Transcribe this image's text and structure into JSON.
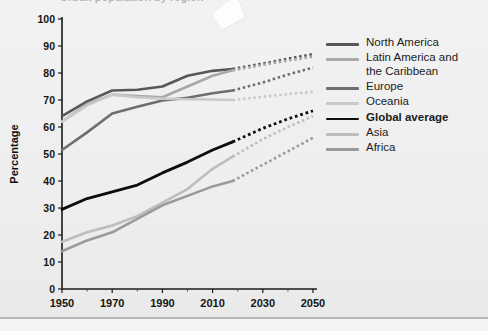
{
  "page": {
    "background_color": "#efefef",
    "partial_title_clipped": "Urban population by region"
  },
  "decor": {
    "paper_scrap_name": "paper-scrap-artifact"
  },
  "chart_data": {
    "type": "line",
    "title": "",
    "xlabel": "",
    "ylabel": "Percentage",
    "xlim": [
      1950,
      2050
    ],
    "ylim": [
      0,
      100
    ],
    "grid": false,
    "legend_position": "right",
    "x_ticks": [
      1950,
      1970,
      1990,
      2010,
      2030,
      2050
    ],
    "x_tick_labels": [
      "1950",
      "1970",
      "1990",
      "2010",
      "2030",
      "2050"
    ],
    "x_minor_ticks": [
      1960,
      1980,
      2000,
      2020,
      2040
    ],
    "y_ticks": [
      0,
      10,
      20,
      30,
      40,
      50,
      60,
      70,
      80,
      90,
      100
    ],
    "y_tick_labels": [
      "0",
      "10",
      "20",
      "30",
      "40",
      "50",
      "60",
      "70",
      "80",
      "90",
      "100"
    ],
    "projection_starts": 2018,
    "x": [
      1950,
      1960,
      1970,
      1980,
      1990,
      2000,
      2010,
      2018,
      2030,
      2040,
      2050
    ],
    "series": [
      {
        "name": "North America",
        "color": "#585858",
        "width": 2.6,
        "bold_label": false,
        "values": [
          64,
          69.5,
          73.5,
          73.8,
          75,
          79,
          80.8,
          81.5,
          83.5,
          85.3,
          87
        ]
      },
      {
        "name": "Latin America and\nthe Caribbean",
        "legend_text": "Latin America and the Caribbean",
        "color": "#a8a8a8",
        "width": 2.6,
        "bold_label": false,
        "values": [
          62,
          68.5,
          72,
          71.5,
          71,
          75,
          79,
          81,
          83,
          84.6,
          86
        ]
      },
      {
        "name": "Europe",
        "color": "#6e6e6e",
        "width": 2.6,
        "bold_label": false,
        "values": [
          51.5,
          58,
          65,
          67.5,
          69.8,
          70.8,
          72.5,
          73.5,
          76.5,
          79.4,
          82
        ]
      },
      {
        "name": "Oceania",
        "color": "#c9c9c9",
        "width": 2.6,
        "bold_label": false,
        "values": [
          62,
          68,
          72,
          71,
          70.5,
          70.3,
          70.2,
          70,
          71.2,
          72.2,
          73
        ]
      },
      {
        "name": "Global average",
        "color": "#0d0d0d",
        "width": 2.8,
        "bold_label": true,
        "values": [
          29.5,
          33.5,
          36,
          38.5,
          43,
          47,
          51.5,
          54.5,
          59.5,
          63,
          66
        ]
      },
      {
        "name": "Asia",
        "color": "#bdbdbd",
        "width": 2.6,
        "bold_label": false,
        "values": [
          17.5,
          21,
          23.5,
          27,
          32,
          37,
          44.5,
          49,
          55.5,
          60,
          64
        ]
      },
      {
        "name": "Africa",
        "color": "#9a9a9a",
        "width": 2.6,
        "bold_label": false,
        "values": [
          14,
          18,
          21,
          26,
          31,
          34.5,
          38,
          40,
          46,
          51,
          56
        ]
      }
    ]
  }
}
